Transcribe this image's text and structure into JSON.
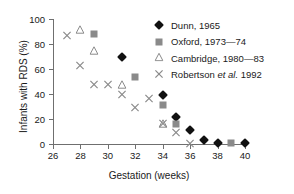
{
  "chart_data": {
    "type": "scatter",
    "title": "",
    "xlabel": "Gestation (weeks)",
    "ylabel": "Infants with RDS (%)",
    "xlim": [
      26,
      40
    ],
    "ylim": [
      0,
      100
    ],
    "xticks": [
      26,
      28,
      30,
      32,
      34,
      36,
      38,
      40
    ],
    "yticks": [
      0,
      20,
      40,
      60,
      80,
      100
    ],
    "grid": false,
    "legend_position": "top-right",
    "series": [
      {
        "name": "Dunn, 1965",
        "marker": "filled-diamond",
        "color": "#111111",
        "points": [
          {
            "x": 31,
            "y": 70
          },
          {
            "x": 34,
            "y": 39
          },
          {
            "x": 35,
            "y": 22
          },
          {
            "x": 36,
            "y": 11
          },
          {
            "x": 37,
            "y": 3
          },
          {
            "x": 38,
            "y": 0.5
          },
          {
            "x": 40,
            "y": 0.5
          }
        ]
      },
      {
        "name": "Oxford, 1973—74",
        "marker": "filled-square",
        "color": "#8a8a8a",
        "points": [
          {
            "x": 29,
            "y": 88
          },
          {
            "x": 32,
            "y": 54
          },
          {
            "x": 34,
            "y": 31
          },
          {
            "x": 35,
            "y": 16
          },
          {
            "x": 39,
            "y": 0.5
          }
        ]
      },
      {
        "name": "Cambridge, 1980—83",
        "marker": "open-triangle",
        "color": "#8a8a8a",
        "points": [
          {
            "x": 28,
            "y": 92
          },
          {
            "x": 29,
            "y": 75
          },
          {
            "x": 31,
            "y": 48
          },
          {
            "x": 34,
            "y": 17
          }
        ]
      },
      {
        "name": "Robertson et al. 1992",
        "marker": "cross",
        "color": "#8a8a8a",
        "points": [
          {
            "x": 27,
            "y": 87
          },
          {
            "x": 28,
            "y": 63
          },
          {
            "x": 29,
            "y": 48
          },
          {
            "x": 30,
            "y": 48
          },
          {
            "x": 31,
            "y": 40
          },
          {
            "x": 32,
            "y": 30
          },
          {
            "x": 33,
            "y": 37
          },
          {
            "x": 34,
            "y": 17
          },
          {
            "x": 35,
            "y": 10
          },
          {
            "x": 36,
            "y": 1
          }
        ]
      }
    ]
  },
  "legend": {
    "items": [
      {
        "label_pre": "Dunn, 1965",
        "label_em": "",
        "label_post": ""
      },
      {
        "label_pre": "Oxford, 1973—74",
        "label_em": "",
        "label_post": ""
      },
      {
        "label_pre": "Cambridge, 1980—83",
        "label_em": "",
        "label_post": ""
      },
      {
        "label_pre": "Robertson ",
        "label_em": "et al.",
        "label_post": " 1992"
      }
    ]
  }
}
